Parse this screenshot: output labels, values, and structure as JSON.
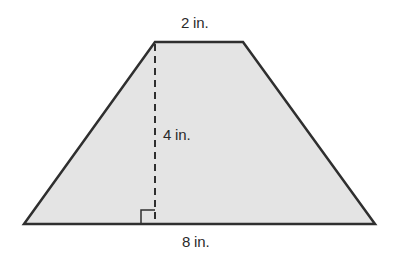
{
  "figure": {
    "shape": "trapezoid",
    "fill_color": "#e4e4e4",
    "stroke_color": "#2f2f2f",
    "labels": {
      "top_base": "2 in.",
      "height": "4 in.",
      "bottom_base": "8 in."
    }
  }
}
